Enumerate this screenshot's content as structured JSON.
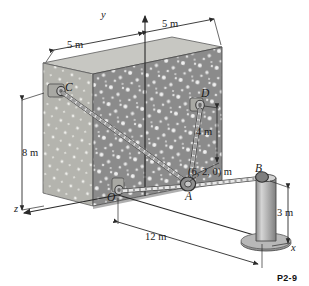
{
  "figure": {
    "kind": "engineering-statics-free-body-diagram",
    "caption": "P2-9",
    "background_color": "#ffffff"
  },
  "axes": [
    {
      "name": "y-axis",
      "label": "y"
    },
    {
      "name": "x-axis",
      "label": "x"
    },
    {
      "name": "z-axis",
      "label": "z"
    }
  ],
  "points": [
    {
      "name": "point-c",
      "label": "C"
    },
    {
      "name": "point-d",
      "label": "D"
    },
    {
      "name": "point-a",
      "label": "A"
    },
    {
      "name": "point-b",
      "label": "B"
    },
    {
      "name": "point-o",
      "label": "O"
    }
  ],
  "coordinate_annotation": {
    "name": "point-a-coordinates",
    "label": "(6, 2, 0) m"
  },
  "dimensions": [
    {
      "name": "dimension-left-5m",
      "label": "5 m"
    },
    {
      "name": "dimension-right-5m",
      "label": "5 m"
    },
    {
      "name": "dimension-wall-height-8m",
      "label": "8 m"
    },
    {
      "name": "dimension-d-height-4m",
      "label": "4 m"
    },
    {
      "name": "dimension-span-12m",
      "label": "12 m"
    },
    {
      "name": "dimension-post-height-3m",
      "label": "3 m"
    }
  ],
  "colors": {
    "wall_face": "#8a8a8a",
    "wall_top": "#c9c9c4",
    "wall_side": "#b6b6b1",
    "speckle": "#efefef",
    "post": "#b3b3b3",
    "post_shade": "#8d8d8d",
    "base_plate": "#a9a9a9",
    "rope": "#dcdcdc",
    "rope_outline": "#6e6e6e",
    "line": "#2a2a2a",
    "bracket": "#9a9a9a"
  }
}
